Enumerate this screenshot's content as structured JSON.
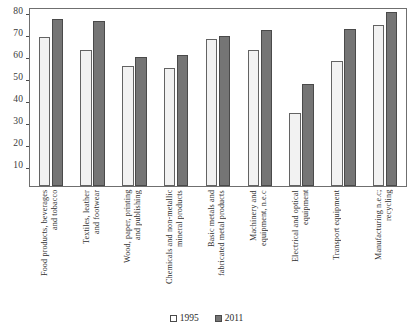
{
  "chart_data": {
    "type": "bar",
    "title": "",
    "subtitle": "",
    "xlabel": "",
    "ylabel": "",
    "ylim": [
      0,
      80
    ],
    "yticks": [
      10,
      20,
      30,
      40,
      50,
      60,
      70,
      80
    ],
    "grid": false,
    "legend_position": "bottom",
    "categories": [
      "Food products, beverages\nand tobacco",
      "Textiles, leather\nand footwear",
      "Wood, paper, printing\nand publishing",
      "Chemicals and non-metallic\nmineral products",
      "Basic metals and\nfabricated metal products",
      "Machinery and\nequipment, n.e.c",
      "Electrical and optical\nequipment",
      "Transport equipment",
      "Manufacturing n.e.c;\nrecycling"
    ],
    "series": [
      {
        "name": "1995",
        "color": "#f2f2f2",
        "values": [
          67,
          61,
          54,
          53,
          66,
          61,
          33,
          56,
          72.5
        ]
      },
      {
        "name": "2011",
        "color": "#757575",
        "values": [
          75,
          74,
          58,
          59,
          67.5,
          70,
          46,
          70.5,
          78
        ]
      }
    ]
  },
  "legend": {
    "items": [
      {
        "label": "1995"
      },
      {
        "label": "2011"
      }
    ]
  }
}
